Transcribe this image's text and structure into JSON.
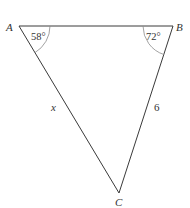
{
  "diagram": {
    "type": "triangle",
    "line_color": "#3a3a3a",
    "arc_color": "#8a8a8a",
    "vertices": {
      "A": {
        "label": "A",
        "x": 19,
        "y": 26
      },
      "B": {
        "label": "B",
        "x": 173,
        "y": 26
      },
      "C": {
        "label": "C",
        "x": 119,
        "y": 193
      }
    },
    "angles": {
      "A": {
        "value": "58°"
      },
      "B": {
        "value": "72°"
      }
    },
    "sides": {
      "AC": {
        "label": "x"
      },
      "BC": {
        "label": "6"
      }
    }
  }
}
